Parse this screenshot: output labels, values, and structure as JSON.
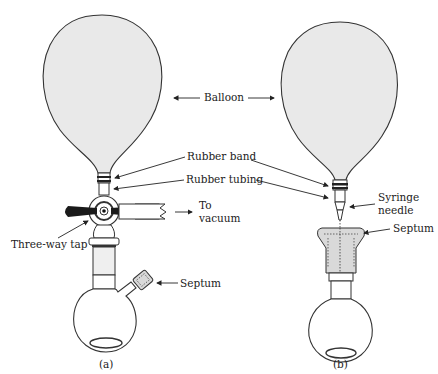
{
  "diagram": {
    "labels": {
      "balloon": "Balloon",
      "rubber_band": "Rubber band",
      "rubber_tubing": "Rubber tubing",
      "to": "To",
      "vacuum": "vacuum",
      "three_way_tap": "Three-way tap",
      "septum_a": "Septum",
      "syringe": "Syringe",
      "needle": "needle",
      "septum_b": "Septum"
    },
    "captions": {
      "a": "(a)",
      "b": "(b)"
    },
    "colors": {
      "balloon_fill": "#e9e9e9",
      "stroke": "#333333",
      "septum_fill": "#d9d9d9",
      "tap_handle": "#1a1a1a"
    }
  }
}
